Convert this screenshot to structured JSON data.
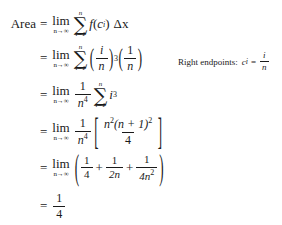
{
  "document": {
    "kind": "math-derivation",
    "background_color": "#ffffff",
    "text_color": "#1a1a1a"
  },
  "derivation": {
    "label": "Area",
    "equals": "=",
    "lines": [
      {
        "id": "line-1",
        "lhs": "Area",
        "limit": {
          "operator": "lim",
          "subscript": "n→∞"
        },
        "sum": {
          "glyph": "∑",
          "upper": "n",
          "lower": "i=1"
        },
        "summand": "f(c_i)",
        "function_name": "f",
        "variable": "c",
        "index": "i",
        "differential": "Δx"
      },
      {
        "id": "line-2",
        "lhs": "",
        "limit": {
          "operator": "lim",
          "subscript": "n→∞"
        },
        "sum": {
          "glyph": "∑",
          "upper": "n",
          "lower": "i=1"
        },
        "factor_1": {
          "numerator": "i",
          "denominator": "n",
          "exponent": "3"
        },
        "factor_2": {
          "numerator": "1",
          "denominator": "n"
        }
      },
      {
        "id": "line-3",
        "lhs": "",
        "limit": {
          "operator": "lim",
          "subscript": "n→∞"
        },
        "coefficient": {
          "numerator": "1",
          "denominator": "n",
          "denominator_exponent": "4"
        },
        "sum": {
          "glyph": "∑",
          "upper": "n",
          "lower": "i=1"
        },
        "summand_base": "i",
        "summand_exponent": "3"
      },
      {
        "id": "line-4",
        "lhs": "",
        "limit": {
          "operator": "lim",
          "subscript": "n→∞"
        },
        "coefficient": {
          "numerator": "1",
          "denominator": "n",
          "denominator_exponent": "4"
        },
        "bracket_open": "[",
        "bracket_close": "]",
        "numerator_base": "n",
        "numerator_exponent": "2",
        "numerator_factor": "(n + 1)",
        "numerator_factor_exponent": "2",
        "denominator": "4"
      },
      {
        "id": "line-5",
        "lhs": "",
        "limit": {
          "operator": "lim",
          "subscript": "n→∞"
        },
        "paren_open": "(",
        "paren_close": ")",
        "term_1": {
          "numerator": "1",
          "denominator": "4"
        },
        "plus_1": "+",
        "term_2": {
          "numerator": "1",
          "denominator": "2n"
        },
        "plus_2": "+",
        "term_3": {
          "numerator": "1",
          "denominator": "4n",
          "denominator_exponent": "2"
        }
      },
      {
        "id": "line-6",
        "lhs": "",
        "result": {
          "numerator": "1",
          "denominator": "4"
        }
      }
    ]
  },
  "annotation": {
    "label": "Right endpoints:",
    "variable": "c",
    "subscript": "i",
    "equals": "=",
    "value": {
      "numerator": "i",
      "denominator": "n"
    }
  }
}
